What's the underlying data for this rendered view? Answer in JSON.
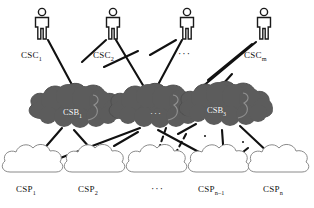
{
  "diagram": {
    "colors": {
      "line": "#111111",
      "broker_cloud_fill": "#5c5c5c",
      "broker_cloud_edge": "#4a4a4a",
      "broker_label_text": "#ffffff",
      "provider_cloud_fill": "#ffffff",
      "provider_cloud_edge": "#8a8a8a",
      "person_stroke": "#1a1a1a",
      "background": "#ffffff"
    },
    "layers": [
      {
        "id": "csc",
        "name": "Cloud Service Consumers",
        "icon": "person-icon",
        "nodes": [
          {
            "id": "csc1",
            "label": "CSC",
            "sub": "1",
            "x": 42,
            "y": 30
          },
          {
            "id": "csc2",
            "label": "CSC",
            "sub": "2",
            "x": 113,
            "y": 30
          },
          {
            "id": "cscd",
            "label": "···",
            "sub": "",
            "x": 186,
            "y": 30
          },
          {
            "id": "cscm",
            "label": "CSC",
            "sub": "m",
            "x": 263,
            "y": 30
          }
        ],
        "ellipsis_label": "···"
      },
      {
        "id": "csb",
        "name": "Cloud Service Brokers",
        "icon": "dark-cloud-icon",
        "nodes": [
          {
            "id": "csb1",
            "label": "CSB",
            "sub": "1",
            "x": 78,
            "y": 114
          },
          {
            "id": "csbd",
            "label": "···",
            "sub": "",
            "x": 158,
            "y": 114
          },
          {
            "id": "csb3",
            "label": "CSB",
            "sub": "3",
            "x": 222,
            "y": 112
          }
        ],
        "ellipsis_label": "···"
      },
      {
        "id": "csp",
        "name": "Cloud Service Providers",
        "icon": "cloud-icon",
        "nodes": [
          {
            "id": "csp1",
            "label": "CSP",
            "sub": "1",
            "x": 36,
            "y": 172
          },
          {
            "id": "csp2",
            "label": "CSP",
            "sub": "2",
            "x": 98,
            "y": 172
          },
          {
            "id": "cspd",
            "label": "···",
            "sub": "",
            "x": 158,
            "y": 172
          },
          {
            "id": "cspn1",
            "label": "CSP",
            "sub": "n–1",
            "x": 222,
            "y": 172
          },
          {
            "id": "cspn",
            "label": "CSP",
            "sub": "n",
            "x": 282,
            "y": 172
          }
        ],
        "ellipsis_label": "···"
      }
    ],
    "labels": {
      "csc1": "CSC",
      "csc1_sub": "1",
      "csc2": "CSC",
      "csc2_sub": "2",
      "csc_mid_dots": "···",
      "cscm": "CSC",
      "cscm_sub": "m",
      "csb1": "CSB",
      "csb1_sub": "1",
      "csb_mid_dots": "···",
      "csb3": "CSB",
      "csb3_sub": "3",
      "csp1": "CSP",
      "csp1_sub": "1",
      "csp2": "CSP",
      "csp2_sub": "2",
      "csp_mid_dots": "···",
      "cspn1": "CSP",
      "cspn1_sub": "n–1",
      "cspn": "CSP",
      "cspn_sub": "n"
    },
    "edges": {
      "style_solid": "solid",
      "style_dashed": "dashed",
      "count_consumer_broker": 9,
      "count_broker_provider": 10
    }
  }
}
